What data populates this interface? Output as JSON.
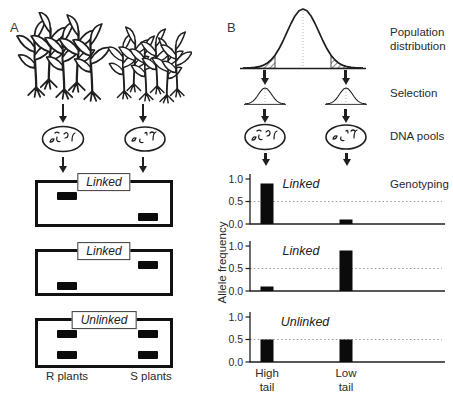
{
  "colors": {
    "ink": "#1f1f1f",
    "band": "#0b0b0b",
    "ref_line": "#999999",
    "hatch": "#3a3a3a"
  },
  "panel_a": {
    "label": "A",
    "gels": [
      {
        "tag": "Linked",
        "bands": [
          {
            "lane": "R",
            "pos": "upper"
          },
          {
            "lane": "S",
            "pos": "lower"
          }
        ]
      },
      {
        "tag": "Linked",
        "bands": [
          {
            "lane": "S",
            "pos": "upper"
          },
          {
            "lane": "R",
            "pos": "lower"
          }
        ]
      },
      {
        "tag": "Unlinked",
        "bands": [
          {
            "lane": "R",
            "pos": "upper"
          },
          {
            "lane": "R",
            "pos": "lower"
          },
          {
            "lane": "S",
            "pos": "upper"
          },
          {
            "lane": "S",
            "pos": "lower"
          }
        ]
      }
    ],
    "lane_labels": [
      "R plants",
      "S plants"
    ]
  },
  "panel_b": {
    "label": "B",
    "step_labels": [
      {
        "lines": [
          "Population",
          "distribution"
        ]
      },
      {
        "lines": [
          "Selection"
        ]
      },
      {
        "lines": [
          "DNA pools"
        ]
      },
      {
        "lines": [
          "Genotyping"
        ]
      }
    ],
    "y_axis_label": "Allele frequency",
    "tail_labels": [
      {
        "line1": "High",
        "line2": "tail"
      },
      {
        "line1": "Low",
        "line2": "tail"
      }
    ]
  },
  "chart_data": [
    {
      "type": "bar",
      "title": "Linked",
      "categories": [
        "High tail",
        "Low tail"
      ],
      "values": [
        0.9,
        0.1
      ],
      "ylabel": "Allele frequency",
      "ylim": [
        0,
        1
      ],
      "yticks": [
        "1.0",
        "0.5",
        "0.0"
      ],
      "ref_line": 0.5,
      "grid": false
    },
    {
      "type": "bar",
      "title": "Linked",
      "categories": [
        "High tail",
        "Low tail"
      ],
      "values": [
        0.1,
        0.9
      ],
      "ylabel": "Allele frequency",
      "ylim": [
        0,
        1
      ],
      "yticks": [
        "1.0",
        "0.5",
        "0.0"
      ],
      "ref_line": 0.5,
      "grid": false
    },
    {
      "type": "bar",
      "title": "Unlinked",
      "categories": [
        "High tail",
        "Low tail"
      ],
      "values": [
        0.5,
        0.5
      ],
      "ylabel": "Allele frequency",
      "ylim": [
        0,
        1
      ],
      "yticks": [
        "1.0",
        "0.5",
        "0.0"
      ],
      "ref_line": 0.5,
      "grid": false
    }
  ]
}
